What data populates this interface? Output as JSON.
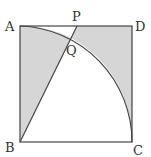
{
  "figure": {
    "type": "geometry-square-quarter-circle",
    "labels": {
      "A": "A",
      "B": "B",
      "C": "C",
      "D": "D",
      "P": "P",
      "Q": "Q"
    },
    "colors": {
      "stroke": "#444444",
      "shade": "#d6d6d6",
      "background": "#ffffff"
    }
  }
}
